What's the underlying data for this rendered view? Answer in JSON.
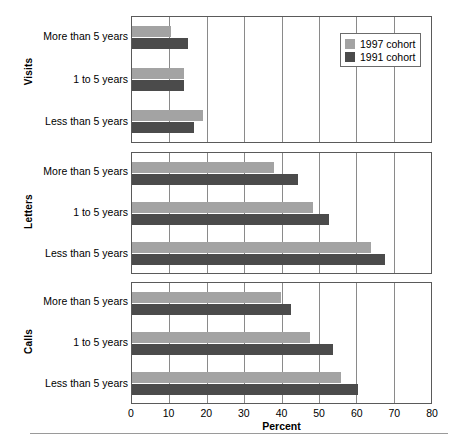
{
  "chart_data": {
    "type": "bar",
    "orientation": "horizontal",
    "title": "",
    "xlabel": "Percent",
    "ylabel": "",
    "xlim": [
      0,
      80
    ],
    "xticks": [
      0,
      10,
      20,
      30,
      40,
      50,
      60,
      70,
      80
    ],
    "grid": true,
    "legend_position": "top-right",
    "categories": [
      "Less than 5 years",
      "1 to 5 years",
      "More than 5 years"
    ],
    "series": [
      {
        "name": "1997 cohort",
        "color": "#a3a3a3"
      },
      {
        "name": "1991 cohort",
        "color": "#4b4b4b"
      }
    ],
    "panels": [
      {
        "label": "Visits",
        "bars": [
          {
            "category": "More than 5 years",
            "1997 cohort": 10.4,
            "1991 cohort": 14.9
          },
          {
            "category": "1 to 5 years",
            "1997 cohort": 14.0,
            "1991 cohort": 14.0
          },
          {
            "category": "Less than 5 years",
            "1997 cohort": 19.1,
            "1991 cohort": 16.6
          }
        ]
      },
      {
        "label": "Letters",
        "bars": [
          {
            "category": "More than 5 years",
            "1997 cohort": 37.9,
            "1991 cohort": 44.3
          },
          {
            "category": "1 to 5 years",
            "1997 cohort": 48.5,
            "1991 cohort": 52.6
          },
          {
            "category": "Less than 5 years",
            "1997 cohort": 64.0,
            "1991 cohort": 67.6
          }
        ]
      },
      {
        "label": "Calls",
        "bars": [
          {
            "category": "More than 5 years",
            "1997 cohort": 39.8,
            "1991 cohort": 42.6
          },
          {
            "category": "1 to 5 years",
            "1997 cohort": 47.7,
            "1991 cohort": 53.7
          },
          {
            "category": "Less than 5 years",
            "1997 cohort": 55.8,
            "1991 cohort": 60.4
          }
        ]
      }
    ]
  },
  "axis": {
    "x_title": "Percent",
    "tick_labels": [
      "0",
      "10",
      "20",
      "30",
      "40",
      "50",
      "60",
      "70",
      "80"
    ]
  },
  "legend": {
    "entries": [
      {
        "label": "1997 cohort",
        "color": "#a3a3a3"
      },
      {
        "label": "1991 cohort",
        "color": "#4b4b4b"
      }
    ]
  },
  "panel_titles": {
    "visits": "Visits",
    "letters": "Letters",
    "calls": "Calls"
  },
  "category_labels": {
    "more": "More than 5 years",
    "mid": "1 to 5 years",
    "less": "Less than 5 years"
  }
}
